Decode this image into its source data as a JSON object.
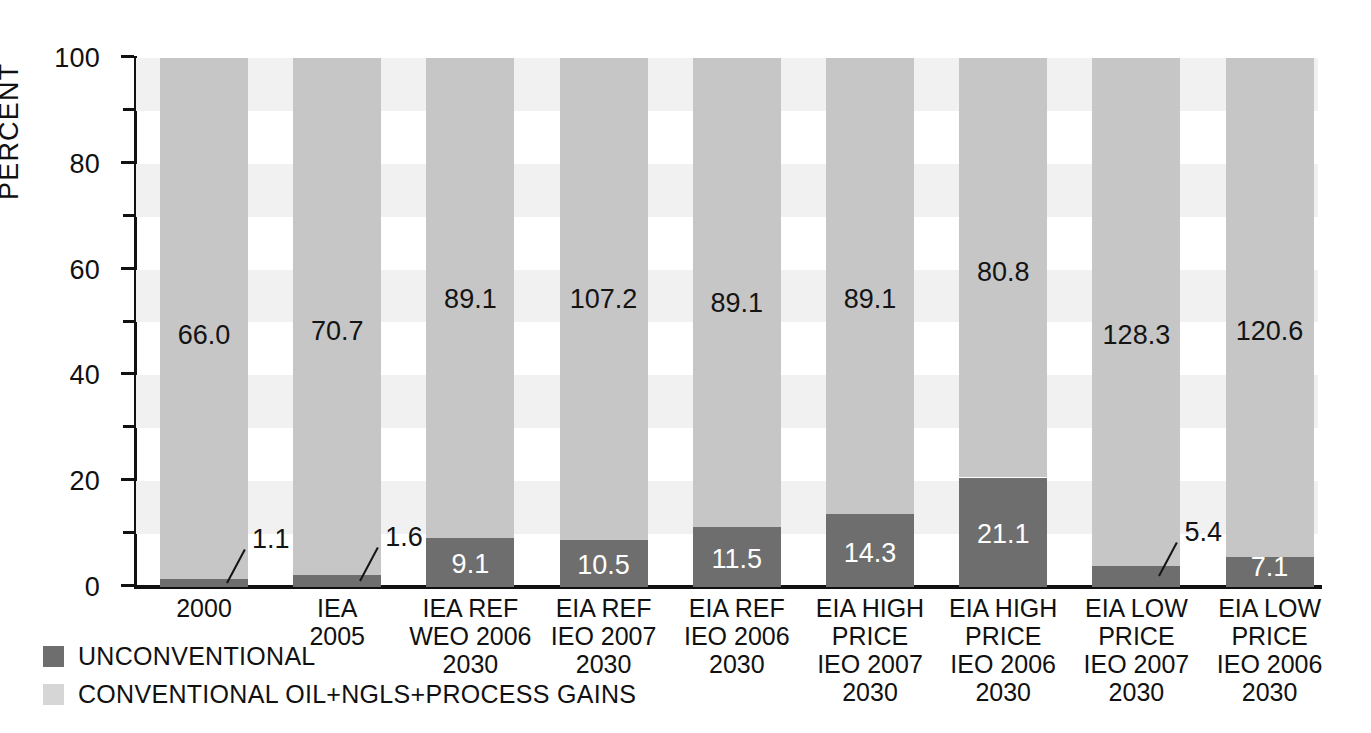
{
  "chart_data": {
    "type": "bar",
    "subtype": "stacked-percent",
    "title": "",
    "xlabel": "",
    "ylabel": "PERCENT",
    "ylim": [
      0,
      100
    ],
    "yticks": [
      0,
      20,
      40,
      60,
      80,
      100
    ],
    "ytick_labels": [
      "0",
      "20",
      "40",
      "60",
      "80",
      "100"
    ],
    "minor_ticks": [
      10,
      30,
      50,
      70,
      90
    ],
    "grid": "alternating horizontal bands",
    "legend_position": "below-left",
    "categories": [
      "2000",
      "IEA\n2005",
      "IEA REF\nWEO 2006\n2030",
      "EIA REF\nIEO 2007\n2030",
      "EIA REF\nIEO 2006\n2030",
      "EIA HIGH\nPRICE\nIEO 2007\n2030",
      "EIA HIGH\nPRICE\nIEO 2006\n2030",
      "EIA LOW\nPRICE\nIEO 2007\n2030",
      "EIA LOW\nPRICE\nIEO 2006\n2030"
    ],
    "series": [
      {
        "name": "UNCONVENTIONAL",
        "color": "#6e6e6e",
        "percent": [
          1.6,
          2.2,
          9.3,
          8.9,
          11.4,
          13.8,
          20.7,
          4.0,
          5.6
        ],
        "labels": [
          "1.1",
          "1.6",
          "9.1",
          "10.5",
          "11.5",
          "14.3",
          "21.1",
          "5.4",
          "7.1"
        ]
      },
      {
        "name": "CONVENTIONAL OIL+NGLS+PROCESS GAINS",
        "color": "#c6c6c6",
        "percent": [
          98.4,
          97.8,
          90.7,
          91.1,
          88.6,
          86.2,
          79.3,
          96.0,
          94.4
        ],
        "labels": [
          "66.0",
          "70.7",
          "89.1",
          "107.2",
          "89.1",
          "89.1",
          "80.8",
          "128.3",
          "120.6"
        ]
      }
    ],
    "label_style": {
      "callout_indices": [
        0,
        1,
        7
      ],
      "note": "small unconventional segments use leader lines with labels outside the bar"
    }
  },
  "legend": {
    "items": [
      {
        "label": "UNCONVENTIONAL",
        "color": "#6e6e6e"
      },
      {
        "label": "CONVENTIONAL OIL+NGLS+PROCESS GAINS",
        "color": "#d6d6d6"
      }
    ]
  },
  "colors": {
    "unconventional": "#6e6e6e",
    "conventional": "#c6c6c6",
    "band": "#f1f1f1",
    "axis": "#111111",
    "text": "#141414"
  }
}
